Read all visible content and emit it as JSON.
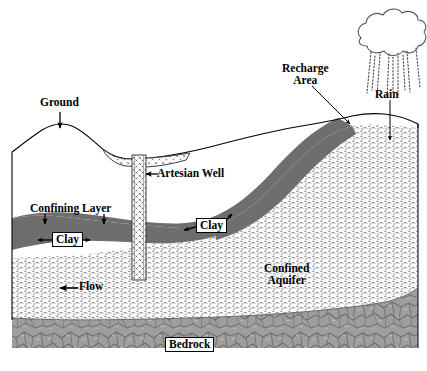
{
  "diagram": {
    "type": "geological-cross-section",
    "width": 427,
    "height": 371
  },
  "labels": {
    "ground": "Ground",
    "artesian_well": "Artesian Well",
    "confining_layer": "Confining Layer",
    "clay_left": "Clay",
    "clay_right": "Clay",
    "flow": "Flow",
    "confined_aquifer_line1": "Confined",
    "confined_aquifer_line2": "Aquifer",
    "recharge_area_line1": "Recharge",
    "recharge_area_line2": "Area",
    "rain": "Rain",
    "bedrock": "Bedrock"
  },
  "colors": {
    "clay_fill": "#6e6e6e",
    "bedrock_fill": "#9a9a9a",
    "aquifer_fill": "#ffffff",
    "aquifer_hatch": "#8c8c8c",
    "outline": "#000000",
    "background": "#ffffff",
    "alluvium_fill": "#ffffff",
    "well_fill": "#ffffff"
  },
  "layers": [
    {
      "name": "ground-surface",
      "description": "Topographic land surface with hill on left and slope rising to recharge area on right"
    },
    {
      "name": "alluvium-deposit",
      "description": "Stippled valley-fill deposit around the well head"
    },
    {
      "name": "confining-layer-clay",
      "description": "Dark gray clay confining layer, dipping upward toward the recharge area"
    },
    {
      "name": "confined-aquifer",
      "description": "Hatched permeable unit beneath the clay, outcropping at the recharge area"
    },
    {
      "name": "bedrock",
      "description": "Mottled impermeable basement rock at the base"
    },
    {
      "name": "artesian-well",
      "description": "Vertical cross-hatched well casing penetrating the clay into the aquifer"
    }
  ],
  "annotations": [
    {
      "name": "ground",
      "arrow": "down"
    },
    {
      "name": "artesian-well",
      "arrow": "left"
    },
    {
      "name": "confining-layer",
      "arrow": "down-double"
    },
    {
      "name": "clay-left",
      "arrow": "left-right"
    },
    {
      "name": "clay-right",
      "arrow": "left-and-up-right"
    },
    {
      "name": "flow",
      "arrow": "left"
    },
    {
      "name": "recharge-area",
      "arrow": "down-right-leader"
    },
    {
      "name": "rain",
      "arrow": "down"
    },
    {
      "name": "confined-aquifer",
      "arrow": "none"
    },
    {
      "name": "bedrock",
      "arrow": "none"
    }
  ]
}
